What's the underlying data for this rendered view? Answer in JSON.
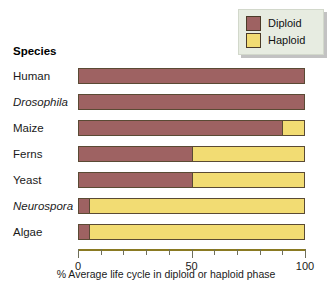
{
  "header": {
    "species_label": "Species"
  },
  "legend": {
    "position": "top-right",
    "entries": [
      {
        "label": "Diploid",
        "color": "#9e6262",
        "key": "diploid"
      },
      {
        "label": "Haploid",
        "color": "#f2dc73",
        "key": "haploid"
      }
    ]
  },
  "axis": {
    "title": "% Average life cycle in diploid or haploid phase",
    "labeled_ticks": [
      "0",
      "50",
      "100"
    ]
  },
  "chart_data": {
    "type": "bar",
    "orientation": "horizontal",
    "stacked": true,
    "title": "",
    "subtitle": "",
    "xlabel": "% Average life cycle in diploid or haploid phase",
    "ylabel": "Species",
    "xlim": [
      0,
      100
    ],
    "xticks": [
      0,
      10,
      20,
      30,
      40,
      50,
      60,
      70,
      80,
      90,
      100
    ],
    "xtick_labels": [
      "0",
      "",
      "",
      "",
      "",
      "50",
      "",
      "",
      "",
      "",
      "100"
    ],
    "grid": false,
    "legend_position": "top-right",
    "categories": [
      "Human",
      "Drosophila",
      "Maize",
      "Ferns",
      "Yeast",
      "Neurospora",
      "Algae"
    ],
    "category_styles": [
      "normal",
      "italic",
      "normal",
      "normal",
      "normal",
      "italic",
      "normal"
    ],
    "series": [
      {
        "name": "Diploid",
        "color": "#9e6262",
        "values": [
          100,
          100,
          90,
          50,
          50,
          5,
          5
        ]
      },
      {
        "name": "Haploid",
        "color": "#f2dc73",
        "values": [
          0,
          0,
          10,
          50,
          50,
          95,
          95
        ]
      }
    ]
  }
}
